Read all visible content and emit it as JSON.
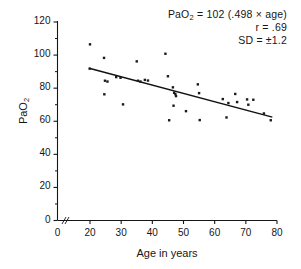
{
  "chart_data": {
    "type": "scatter",
    "title": "",
    "xlabel": "Age in years",
    "ylabel": "PaO2",
    "ylabel_display": "PaO",
    "ylabel_sub": "2",
    "xlim": [
      0,
      80
    ],
    "ylim": [
      0,
      120
    ],
    "xticks": [
      0,
      20,
      30,
      40,
      50,
      60,
      70,
      80
    ],
    "yticks": [
      0,
      20,
      40,
      60,
      80,
      100,
      120
    ],
    "y_minor_ticks": [
      10,
      30,
      50,
      70,
      90,
      110
    ],
    "x_axis_break": true,
    "grid": false,
    "legend": null,
    "annotations": {
      "equation_prefix": "PaO",
      "equation_sub": "2",
      "equation_rest": " = 102 (.498 × age)",
      "equation_full": "PaO2 = 102 (.498 × age)",
      "r_line": "r = .69",
      "sd_line": "SD = ±1.2"
    },
    "regression_line": {
      "x_start": 19.5,
      "y_start": 92.0,
      "x_end": 78.5,
      "y_end": 62.5,
      "intercept": 102,
      "slope": -0.498
    },
    "points": [
      {
        "x": 20.0,
        "y": 106.5
      },
      {
        "x": 19.8,
        "y": 91.8
      },
      {
        "x": 24.5,
        "y": 98.3
      },
      {
        "x": 24.8,
        "y": 84.5
      },
      {
        "x": 25.6,
        "y": 84.0
      },
      {
        "x": 24.6,
        "y": 76.3
      },
      {
        "x": 28.4,
        "y": 86.7
      },
      {
        "x": 29.8,
        "y": 86.3
      },
      {
        "x": 30.6,
        "y": 70.2
      },
      {
        "x": 35.0,
        "y": 96.2
      },
      {
        "x": 35.4,
        "y": 84.5
      },
      {
        "x": 36.2,
        "y": 84.0
      },
      {
        "x": 37.6,
        "y": 85.0
      },
      {
        "x": 38.6,
        "y": 84.6
      },
      {
        "x": 44.2,
        "y": 100.8
      },
      {
        "x": 45.0,
        "y": 87.2
      },
      {
        "x": 45.4,
        "y": 60.6
      },
      {
        "x": 46.6,
        "y": 80.5
      },
      {
        "x": 46.8,
        "y": 69.4
      },
      {
        "x": 47.0,
        "y": 77.2
      },
      {
        "x": 47.4,
        "y": 76.4
      },
      {
        "x": 47.6,
        "y": 75.2
      },
      {
        "x": 50.8,
        "y": 66.1
      },
      {
        "x": 54.6,
        "y": 82.3
      },
      {
        "x": 55.0,
        "y": 77.0
      },
      {
        "x": 55.2,
        "y": 60.7
      },
      {
        "x": 62.6,
        "y": 73.4
      },
      {
        "x": 63.8,
        "y": 62.3
      },
      {
        "x": 64.4,
        "y": 71.0
      },
      {
        "x": 66.6,
        "y": 76.5
      },
      {
        "x": 67.2,
        "y": 71.6
      },
      {
        "x": 70.4,
        "y": 73.2
      },
      {
        "x": 70.8,
        "y": 70.0
      },
      {
        "x": 72.4,
        "y": 73.0
      },
      {
        "x": 75.8,
        "y": 64.7
      },
      {
        "x": 78.0,
        "y": 60.6
      }
    ]
  },
  "axis": {
    "x_tick_labels": [
      "0",
      "20",
      "30",
      "40",
      "50",
      "60",
      "70",
      "80"
    ],
    "y_tick_labels": [
      "0",
      "20",
      "40",
      "60",
      "80",
      "100",
      "120"
    ]
  },
  "colors": {
    "ink": "#161616",
    "background": "#ffffff",
    "point": "#1a1a1a",
    "line": "#111111"
  }
}
